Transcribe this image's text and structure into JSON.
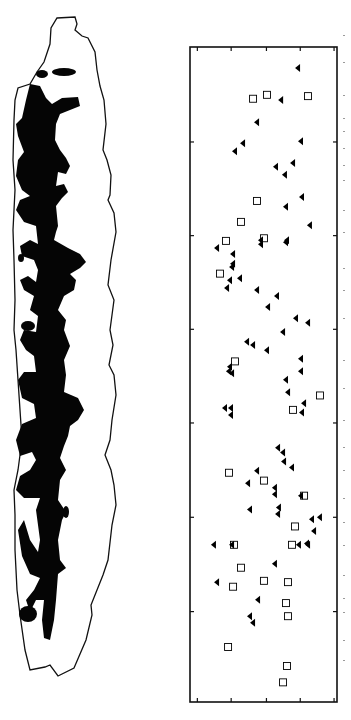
{
  "figure": {
    "left_panel": {
      "description": "Outline silhouette with black filled interior pattern",
      "fill_color": "#000000",
      "outline_color": "#000000"
    },
    "caption_text": ""
  },
  "chart_data": {
    "type": "scatter",
    "title": "",
    "xlabel": "",
    "ylabel": "",
    "orientation": "rotated 90 degrees",
    "xlim": [
      0,
      100
    ],
    "ylim": [
      0,
      100
    ],
    "grid": false,
    "legend": "none",
    "x_ticks_fraction": [
      0.05,
      0.28,
      0.52,
      0.75,
      0.98
    ],
    "y_ticks_fraction": [
      0.145,
      0.288,
      0.431,
      0.574,
      0.718,
      0.862
    ],
    "tick_labels": [],
    "series": [
      {
        "name": "triangles",
        "marker": "filled-triangle-left",
        "color": "#000000",
        "points": [
          [
            73.5,
            3.2
          ],
          [
            62.0,
            8.1
          ],
          [
            45.6,
            11.5
          ],
          [
            36.1,
            14.7
          ],
          [
            30.6,
            15.9
          ],
          [
            75.5,
            14.4
          ],
          [
            70.1,
            17.7
          ],
          [
            58.5,
            18.3
          ],
          [
            64.6,
            19.5
          ],
          [
            76.2,
            22.9
          ],
          [
            65.3,
            24.4
          ],
          [
            81.6,
            27.2
          ],
          [
            66.0,
            29.5
          ],
          [
            48.3,
            30.1
          ],
          [
            48.3,
            29.5
          ],
          [
            65.3,
            29.8
          ],
          [
            18.4,
            30.7
          ],
          [
            29.3,
            31.6
          ],
          [
            29.3,
            33.1
          ],
          [
            28.6,
            33.6
          ],
          [
            27.2,
            35.6
          ],
          [
            34.0,
            35.3
          ],
          [
            25.2,
            36.8
          ],
          [
            45.6,
            37.1
          ],
          [
            59.2,
            38.0
          ],
          [
            53.1,
            39.7
          ],
          [
            72.1,
            41.4
          ],
          [
            63.3,
            43.5
          ],
          [
            80.3,
            42.1
          ],
          [
            38.8,
            45.0
          ],
          [
            42.9,
            45.5
          ],
          [
            52.4,
            46.3
          ],
          [
            75.5,
            47.6
          ],
          [
            27.2,
            48.8
          ],
          [
            26.5,
            49.5
          ],
          [
            28.6,
            49.8
          ],
          [
            65.3,
            50.8
          ],
          [
            75.5,
            49.5
          ],
          [
            66.7,
            52.7
          ],
          [
            77.6,
            54.4
          ],
          [
            76.2,
            55.8
          ],
          [
            23.8,
            55.1
          ],
          [
            27.9,
            55.1
          ],
          [
            27.9,
            56.2
          ],
          [
            59.9,
            61.2
          ],
          [
            63.3,
            61.9
          ],
          [
            64.0,
            63.3
          ],
          [
            69.4,
            64.2
          ],
          [
            45.6,
            64.7
          ],
          [
            39.5,
            66.6
          ],
          [
            57.8,
            67.3
          ],
          [
            57.8,
            68.3
          ],
          [
            75.5,
            68.5
          ],
          [
            40.8,
            70.6
          ],
          [
            60.5,
            70.3
          ],
          [
            88.4,
            71.8
          ],
          [
            59.9,
            71.3
          ],
          [
            83.0,
            72.1
          ],
          [
            84.4,
            73.9
          ],
          [
            79.6,
            75.8
          ],
          [
            80.3,
            76.0
          ],
          [
            74.1,
            76.0
          ],
          [
            16.3,
            76.0
          ],
          [
            28.6,
            76.0
          ],
          [
            57.8,
            78.9
          ],
          [
            18.4,
            81.7
          ],
          [
            46.3,
            84.4
          ],
          [
            40.8,
            86.9
          ],
          [
            42.9,
            87.9
          ]
        ]
      },
      {
        "name": "squares",
        "marker": "open-square",
        "color": "#000000",
        "points": [
          [
            42.9,
            7.9
          ],
          [
            52.4,
            7.3
          ],
          [
            80.3,
            7.5
          ],
          [
            45.6,
            23.5
          ],
          [
            34.7,
            26.7
          ],
          [
            24.5,
            29.6
          ],
          [
            50.3,
            29.2
          ],
          [
            20.4,
            34.6
          ],
          [
            30.6,
            48.0
          ],
          [
            88.4,
            53.2
          ],
          [
            70.1,
            55.4
          ],
          [
            26.5,
            65.0
          ],
          [
            50.3,
            66.2
          ],
          [
            77.6,
            68.5
          ],
          [
            71.4,
            73.2
          ],
          [
            29.9,
            76.0
          ],
          [
            69.4,
            76.0
          ],
          [
            34.7,
            79.5
          ],
          [
            50.3,
            81.5
          ],
          [
            66.7,
            81.7
          ],
          [
            29.3,
            82.4
          ],
          [
            65.3,
            84.9
          ],
          [
            66.7,
            86.9
          ],
          [
            25.9,
            91.6
          ],
          [
            66.0,
            94.5
          ],
          [
            63.3,
            97.0
          ]
        ]
      }
    ]
  }
}
